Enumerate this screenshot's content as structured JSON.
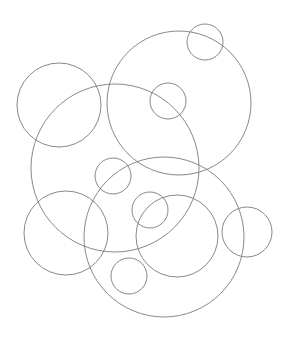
{
  "diagram": {
    "type": "overlapping-circles",
    "background": "#ffffff",
    "stroke": "#7a7a7a",
    "stroke_width": 0.9,
    "circles": [
      {
        "cx": 205,
        "cy": 42,
        "r": 18
      },
      {
        "cx": 179,
        "cy": 103,
        "r": 72
      },
      {
        "cx": 59,
        "cy": 105,
        "r": 42
      },
      {
        "cx": 168,
        "cy": 101,
        "r": 18
      },
      {
        "cx": 115,
        "cy": 168,
        "r": 84
      },
      {
        "cx": 113,
        "cy": 176,
        "r": 18
      },
      {
        "cx": 164,
        "cy": 237,
        "r": 80
      },
      {
        "cx": 150,
        "cy": 210,
        "r": 18
      },
      {
        "cx": 66,
        "cy": 233,
        "r": 42
      },
      {
        "cx": 177,
        "cy": 236,
        "r": 41
      },
      {
        "cx": 247,
        "cy": 232,
        "r": 25
      },
      {
        "cx": 129,
        "cy": 276,
        "r": 18
      }
    ]
  }
}
